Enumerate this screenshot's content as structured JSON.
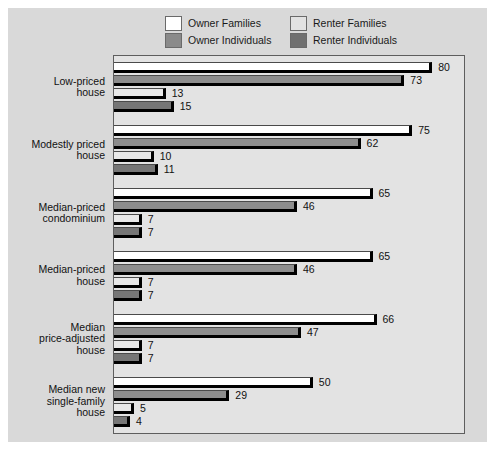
{
  "legend": {
    "items": [
      {
        "label": "Owner Families",
        "swatch": "owner-families-swatch",
        "color": "#ffffff"
      },
      {
        "label": "Owner Individuals",
        "swatch": "owner-individuals-swatch",
        "color": "#8d8d8d"
      },
      {
        "label": "Renter Families",
        "swatch": "renter-families-swatch",
        "color": "#e8e8e8"
      },
      {
        "label": "Renter Individuals",
        "swatch": "renter-individuals-swatch",
        "color": "#767676"
      }
    ]
  },
  "chart_data": {
    "type": "bar",
    "orientation": "horizontal",
    "title": "",
    "xlabel": "",
    "ylabel": "",
    "grid": false,
    "legend_position": "top",
    "xlim": [
      0,
      88
    ],
    "categories": [
      "Low-priced house",
      "Modestly priced house",
      "Median-priced condominium",
      "Median-priced house",
      "Median price-adjusted house",
      "Median new single-family house"
    ],
    "category_lines": [
      [
        "Low-priced",
        "house"
      ],
      [
        "Modestly priced",
        "house"
      ],
      [
        "Median-priced",
        "condominium"
      ],
      [
        "Median-priced",
        "house"
      ],
      [
        "Median",
        "price-adjusted",
        "house"
      ],
      [
        "Median new",
        "single-family",
        "house"
      ]
    ],
    "series": [
      {
        "name": "Owner Families",
        "values": [
          80,
          75,
          65,
          65,
          66,
          50
        ]
      },
      {
        "name": "Owner Individuals",
        "values": [
          73,
          62,
          46,
          46,
          47,
          29
        ]
      },
      {
        "name": "Renter Families",
        "values": [
          13,
          10,
          7,
          7,
          7,
          5
        ]
      },
      {
        "name": "Renter Individuals",
        "values": [
          15,
          11,
          7,
          7,
          7,
          4
        ]
      }
    ]
  },
  "colors": {
    "panel_background": "#d9d9d9",
    "plot_background": "#e3e3e3",
    "plot_border": "#5e5e5e",
    "bar_shadow": "#000000",
    "label_text": "#111111"
  }
}
